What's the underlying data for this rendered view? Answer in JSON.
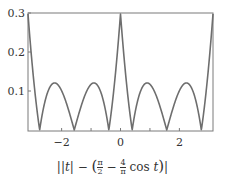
{
  "chart_data": {
    "type": "line",
    "title": "",
    "xlabel": "||t| − (π/2 − (4/π) cos t)|",
    "ylabel": "",
    "xlim": [
      -3.14159,
      3.14159
    ],
    "ylim": [
      0,
      0.3
    ],
    "x_ticks": [
      -2,
      -1,
      0,
      1,
      2
    ],
    "x_tick_labels": [
      "−2",
      "0",
      "2"
    ],
    "x_tick_label_values": [
      -2,
      0,
      2
    ],
    "y_ticks": [
      0.1,
      0.2,
      0.3
    ],
    "y_tick_labels": [
      "0.1",
      "0.2",
      "0.3"
    ],
    "grid": false,
    "legend": null,
    "series": [
      {
        "name": "||t| − (π/2 − (4/π) cos t)|",
        "color": "#6e6e6e",
        "x": [
          -3.1416,
          -2.8,
          -2.5,
          -2.2,
          -2.0,
          -1.8,
          -1.57,
          -1.3,
          -1.0,
          -0.7,
          -0.42,
          -0.2,
          0,
          0.2,
          0.42,
          0.7,
          1.0,
          1.3,
          1.57,
          1.8,
          2.0,
          2.2,
          2.5,
          2.8,
          3.1416
        ],
        "values": [
          0.298,
          0.0,
          0.098,
          0.115,
          0.103,
          0.065,
          0.0,
          0.078,
          0.117,
          0.092,
          0.0,
          0.174,
          0.298,
          0.174,
          0.0,
          0.092,
          0.117,
          0.078,
          0.0,
          0.065,
          0.103,
          0.115,
          0.098,
          0.0,
          0.298
        ]
      }
    ]
  },
  "axes": {
    "line_color": "#7a7a7a",
    "curve_color": "#6e6e6e"
  },
  "caption": "||t| − (π/2 − 4/π cos t)|"
}
